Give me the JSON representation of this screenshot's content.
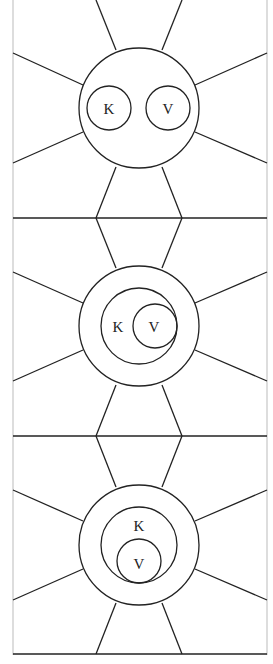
{
  "diagram": {
    "type": "three-panel concentric circle diagram",
    "colors": {
      "stroke": "#222222",
      "border": "#bbbbbb",
      "background": "#ffffff"
    },
    "panels": [
      {
        "label_k": "K",
        "label_v": "V",
        "arrangement": "separate"
      },
      {
        "label_k": "K",
        "label_v": "V",
        "arrangement": "V inside K, tangent right"
      },
      {
        "label_k": "K",
        "label_v": "V",
        "arrangement": "V inside K, tangent bottom"
      }
    ]
  }
}
